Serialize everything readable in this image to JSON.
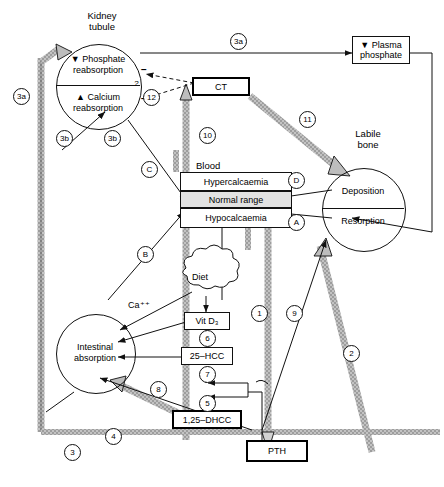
{
  "diagram": {
    "title_nodes": {
      "kidney_tubule": "Kidney\ntubule",
      "labile_bone": "Labile\nbone",
      "blood": "Blood"
    },
    "kidney": {
      "phosphate": "Phosphate\nreabsorption",
      "calcium": "Calcium\nreabsorption",
      "phosphate_arrow": "▼",
      "calcium_arrow": "▲"
    },
    "blood_bands": [
      {
        "label": "Hypercalcaemia",
        "state": "high"
      },
      {
        "label": "Normal range",
        "state": "normal"
      },
      {
        "label": "Hypocalcaemia",
        "state": "low"
      }
    ],
    "bone": {
      "deposition": "Deposition",
      "resorption": "Resorption"
    },
    "intestine": {
      "label": "Intestinal\nabsorption"
    },
    "boxes": {
      "ct": "CT",
      "pth": "PTH",
      "plasma_phosphate": "Plasma\nphosphate",
      "plasma_phosphate_arrow": "▼",
      "vit_d3": "Vit D₃",
      "hcc25": "25–HCC",
      "dhcc": "1,25–DHCC"
    },
    "diet": "Diet",
    "calcium_ion": "Ca⁺⁺",
    "inhibition_signs": [
      "−",
      "−"
    ],
    "uncertainty_mark": "?",
    "keys": [
      {
        "id": "3a-left",
        "text": "3a"
      },
      {
        "id": "3a-top",
        "text": "3a"
      },
      {
        "id": "3b-left",
        "text": "3b"
      },
      {
        "id": "3b-mid",
        "text": "3b"
      },
      {
        "id": "12",
        "text": "12"
      },
      {
        "id": "10",
        "text": "10"
      },
      {
        "id": "11",
        "text": "11"
      },
      {
        "id": "C",
        "text": "C"
      },
      {
        "id": "B",
        "text": "B"
      },
      {
        "id": "D",
        "text": "D"
      },
      {
        "id": "A",
        "text": "A"
      },
      {
        "id": "6",
        "text": "6"
      },
      {
        "id": "7",
        "text": "7"
      },
      {
        "id": "5",
        "text": "5"
      },
      {
        "id": "8",
        "text": "8"
      },
      {
        "id": "4",
        "text": "4"
      },
      {
        "id": "3",
        "text": "3"
      },
      {
        "id": "1",
        "text": "1"
      },
      {
        "id": "9",
        "text": "9"
      },
      {
        "id": "2",
        "text": "2"
      }
    ],
    "colors": {
      "stroke": "#111111",
      "thick_band": "#b4b4b4",
      "normal_band": "#e2e2e2",
      "background": "#ffffff"
    }
  }
}
